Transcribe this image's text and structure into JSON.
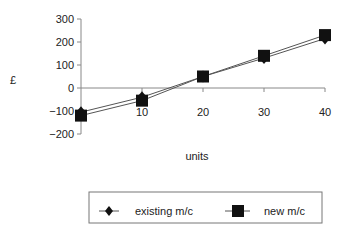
{
  "chart_data": {
    "type": "line",
    "title": "",
    "xlabel": "units",
    "ylabel": "£",
    "x": [
      0,
      10,
      20,
      30,
      40
    ],
    "x_tick_labels": [
      "10",
      "20",
      "30",
      "40"
    ],
    "y_tick_labels": [
      "300",
      "200",
      "100",
      "0",
      "−100",
      "−200"
    ],
    "ylim": [
      -200,
      300
    ],
    "xlim": [
      0,
      40
    ],
    "grid": false,
    "legend_position": "bottom",
    "series": [
      {
        "name": "existing m/c",
        "marker": "diamond",
        "values": [
          -105,
          -40,
          50,
          130,
          215
        ]
      },
      {
        "name": "new m/c",
        "marker": "square",
        "values": [
          -120,
          -55,
          50,
          140,
          230
        ]
      }
    ]
  },
  "axes": {
    "ylabel": "£",
    "xlabel": "units",
    "yticks": [
      {
        "label": "300",
        "value": 300
      },
      {
        "label": "200",
        "value": 200
      },
      {
        "label": "100",
        "value": 100
      },
      {
        "label": "0",
        "value": 0
      },
      {
        "label": "−100",
        "value": -100
      },
      {
        "label": "−200",
        "value": -200
      }
    ],
    "xticks": [
      {
        "label": "10",
        "value": 10
      },
      {
        "label": "20",
        "value": 20
      },
      {
        "label": "30",
        "value": 30
      },
      {
        "label": "40",
        "value": 40
      }
    ]
  },
  "legend": {
    "items": [
      {
        "label": "existing m/c",
        "marker": "diamond-icon"
      },
      {
        "label": "new m/c",
        "marker": "square-icon"
      }
    ]
  },
  "colors": {
    "line": "#555555",
    "marker": "#111111",
    "axis": "#888888"
  }
}
